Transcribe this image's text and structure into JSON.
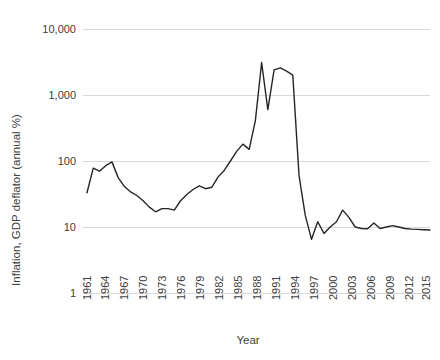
{
  "chart_data": {
    "type": "line",
    "title": "",
    "xlabel": "Year",
    "ylabel": "Inflation, GDP deflator (annual %)",
    "yscale": "log",
    "ylim": [
      1,
      10000
    ],
    "xlim": [
      1961,
      2016
    ],
    "grid": true,
    "legend": "none",
    "ytick_labels": [
      "10,000",
      "1,000",
      "100",
      "10",
      "1"
    ],
    "ytick_values": [
      10000,
      1000,
      100,
      10,
      1
    ],
    "xtick_labels": [
      "1961",
      "1964",
      "1967",
      "1970",
      "1973",
      "1976",
      "1979",
      "1982",
      "1985",
      "1988",
      "1991",
      "1994",
      "1997",
      "2000",
      "2003",
      "2006",
      "2009",
      "2012",
      "2015"
    ],
    "xtick_values": [
      1961,
      1964,
      1967,
      1970,
      1973,
      1976,
      1979,
      1982,
      1985,
      1988,
      1991,
      1994,
      1997,
      2000,
      2003,
      2006,
      2009,
      2012,
      2015
    ],
    "series": [
      {
        "name": "Inflation, GDP deflator (annual %)",
        "color": "#262626",
        "x": [
          1961,
          1962,
          1963,
          1964,
          1965,
          1966,
          1967,
          1968,
          1969,
          1970,
          1971,
          1972,
          1973,
          1974,
          1975,
          1976,
          1977,
          1978,
          1979,
          1980,
          1981,
          1982,
          1983,
          1984,
          1985,
          1986,
          1987,
          1988,
          1989,
          1990,
          1991,
          1992,
          1993,
          1994,
          1995,
          1996,
          1997,
          1998,
          1999,
          2000,
          2001,
          2002,
          2003,
          2004,
          2005,
          2006,
          2007,
          2008,
          2009,
          2010,
          2011,
          2012,
          2013,
          2014,
          2015,
          2016
        ],
        "values": [
          33,
          78,
          70,
          85,
          97,
          56,
          41,
          34,
          30,
          25,
          20,
          17,
          19,
          19,
          18,
          25,
          31,
          37,
          42,
          38,
          40,
          57,
          72,
          100,
          140,
          180,
          150,
          410,
          3100,
          600,
          2400,
          2570,
          2300,
          2000,
          60,
          15,
          6.5,
          12,
          8,
          10,
          12,
          18,
          14,
          10,
          9.5,
          9.4,
          11.5,
          9.5,
          10,
          10.5,
          10,
          9.5,
          9.3,
          9.2,
          9.1,
          9.0
        ]
      }
    ]
  },
  "axis": {
    "x_title": "Year",
    "y_title": "Inflation, GDP deflator (annual %)"
  }
}
